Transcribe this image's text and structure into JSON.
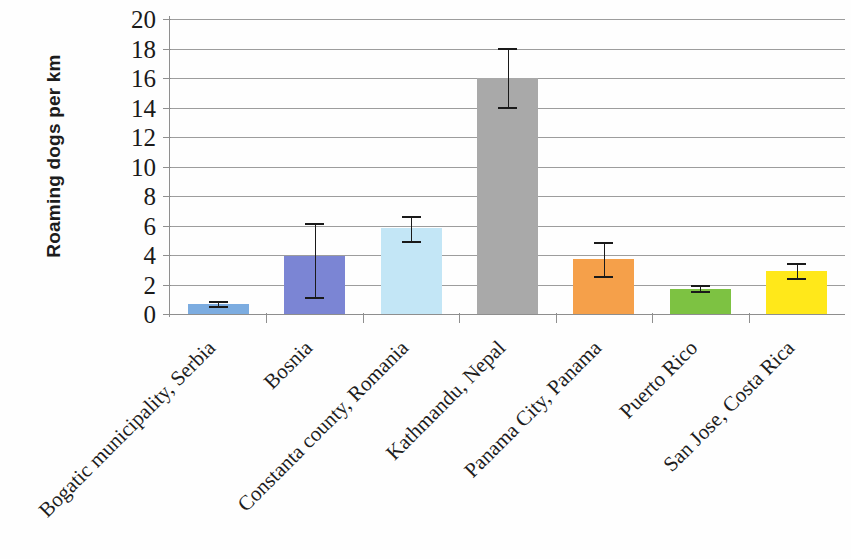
{
  "chart_data": {
    "type": "bar",
    "title": "",
    "xlabel": "",
    "ylabel": "Roaming dogs per km",
    "ylim": [
      0,
      20
    ],
    "ytick_step": 2,
    "ytick_labels": [
      "0",
      "2",
      "4",
      "6",
      "8",
      "10",
      "12",
      "14",
      "16",
      "18",
      "20"
    ],
    "grid": true,
    "legend": "none",
    "categories": [
      "Bogatic municipality, Serbia",
      "Bosnia",
      "Constanta county, Romania",
      "Kathmandu, Nepal",
      "Panama City, Panama",
      "Puerto Rico",
      "San Jose, Costa Rica"
    ],
    "values": [
      0.65,
      3.9,
      5.8,
      16.0,
      3.7,
      1.7,
      2.9
    ],
    "error_low": [
      0.5,
      1.1,
      4.9,
      14.0,
      2.5,
      1.5,
      2.4
    ],
    "error_high": [
      0.8,
      6.1,
      6.6,
      18.0,
      4.8,
      1.9,
      3.4
    ],
    "colors": [
      "#7cace0",
      "#7b85d4",
      "#c3e6f6",
      "#a9a9a9",
      "#f5a04a",
      "#7dc242",
      "#ffe81a"
    ]
  },
  "axis": {
    "y_title": "Roaming dogs per km"
  }
}
